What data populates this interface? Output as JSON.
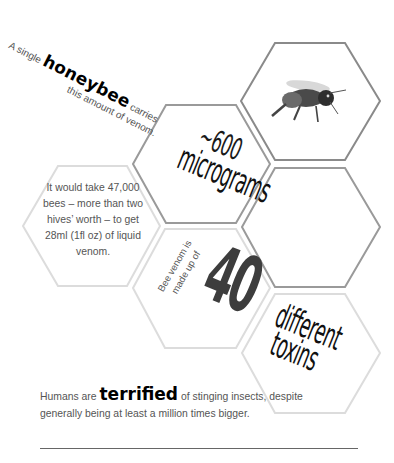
{
  "intro": {
    "line1_pre": "A single ",
    "line1_bold": "honeybee",
    "line1_post": " carries",
    "line2": "this amount of venom."
  },
  "micrograms": {
    "number": "~600",
    "unit": "micrograms"
  },
  "fact_47000": {
    "text": "It would take 47,000 bees – more than two hives’ worth – to get 28ml (1fl oz) of liquid venom."
  },
  "toxins": {
    "lead": "Bee venom is made up of",
    "number": "40",
    "line1": "different",
    "line2": "toxins"
  },
  "bottom": {
    "pre": "Humans are ",
    "bold": "terrified",
    "post": " of stinging insects, despite generally being at least a million times bigger."
  },
  "icons": {
    "bee": "bee-image"
  },
  "colors": {
    "hex_dark": "#8a8a8a",
    "hex_light": "#d9d9d9",
    "text_grey": "#555555",
    "text_black": "#111111"
  }
}
